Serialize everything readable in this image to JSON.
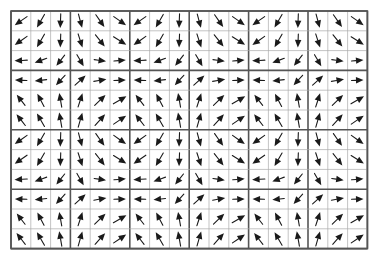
{
  "figure": {
    "kind": "vector-field-grid",
    "title": "",
    "caption": "",
    "background_color": "#ffffff"
  },
  "chart_data": {
    "type": "quiver",
    "title": "",
    "subtitle": "",
    "xlabel": "",
    "ylabel": "",
    "grid": true,
    "legend": null,
    "annotations": [],
    "columns": 18,
    "rows": 12,
    "cell_size_px": 19.8,
    "origin_px": {
      "x": 11,
      "y": 11
    },
    "tile": {
      "description": "periodic 6x6 unit cell tiled 3x horizontally and 2x vertically",
      "cols": 6,
      "rows": 6,
      "repeat_x": 3,
      "repeat_y": 2
    },
    "block_separator": {
      "every_n_cells": 3,
      "thick_line_color": "#555555",
      "thick_line_width_px": 1.6,
      "thin_line_color": "#aaaaaa",
      "thin_line_width_px": 0.7
    },
    "arrow_style": {
      "color": "#1a1a1a",
      "shaft_width_px": 1.1,
      "head_length_px": 7.5,
      "head_width_px": 6.5,
      "length_px": 15
    },
    "angle_units": "degrees, 0 = pointing right (+x), increasing counter-clockwise",
    "tile_angles_deg": [
      [
        215,
        240,
        268,
        285,
        305,
        325
      ],
      [
        215,
        240,
        268,
        288,
        308,
        328
      ],
      [
        183,
        200,
        232,
        300,
        352,
        5
      ],
      [
        178,
        186,
        228,
        42,
        10,
        2
      ],
      [
        128,
        118,
        100,
        72,
        44,
        30
      ],
      [
        128,
        120,
        100,
        74,
        48,
        34
      ]
    ],
    "tile_magnitudes": [
      [
        1.0,
        1.0,
        0.95,
        0.95,
        1.0,
        1.0
      ],
      [
        1.0,
        1.0,
        0.9,
        0.95,
        1.0,
        1.0
      ],
      [
        0.85,
        0.85,
        0.9,
        0.9,
        0.8,
        0.8
      ],
      [
        0.8,
        0.8,
        0.9,
        0.95,
        0.85,
        0.8
      ],
      [
        0.9,
        0.95,
        0.95,
        0.95,
        1.0,
        1.0
      ],
      [
        0.95,
        1.0,
        1.0,
        1.0,
        1.0,
        1.0
      ]
    ],
    "xlim": [
      0,
      18
    ],
    "ylim": [
      0,
      12
    ],
    "xticks": [],
    "yticks": []
  }
}
